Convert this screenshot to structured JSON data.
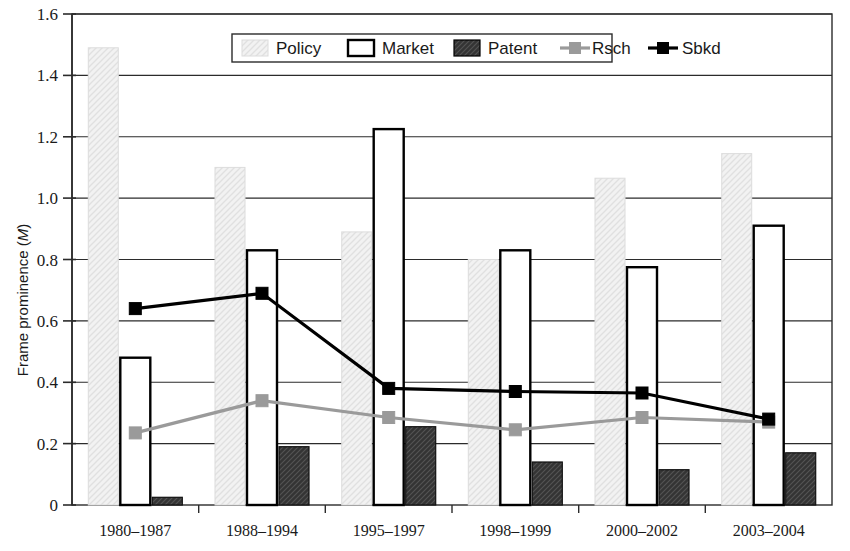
{
  "chart_data": {
    "type": "bar",
    "title": "",
    "xlabel": "",
    "ylabel": "Frame prominence (M)",
    "ylabel_plain": "Frame prominence (",
    "ylabel_italic": "M",
    "ylabel_close": ")",
    "ylim": [
      0,
      1.6
    ],
    "ytick_labels": [
      "0",
      "0.2",
      "0.4",
      "0.6",
      "0.8",
      "1.0",
      "1.2",
      "1.4",
      "1.6"
    ],
    "ytick_values": [
      0,
      0.2,
      0.4,
      0.6,
      0.8,
      1.0,
      1.2,
      1.4,
      1.6
    ],
    "grid": true,
    "grid_orientation": "horizontal",
    "legend_position": "top-center",
    "categories": [
      "1980–1987",
      "1988–1994",
      "1995–1997",
      "1998–1999",
      "2000–2002",
      "2003–2004"
    ],
    "series": [
      {
        "name": "Policy",
        "kind": "bar",
        "style": "light-hatch",
        "color": "#ededed",
        "edge_color": "#d0d0d0",
        "values": [
          1.49,
          1.1,
          0.89,
          0.8,
          1.065,
          1.145
        ]
      },
      {
        "name": "Market",
        "kind": "bar",
        "style": "white-outline",
        "color": "#ffffff",
        "edge_color": "#000000",
        "values": [
          0.48,
          0.83,
          1.225,
          0.83,
          0.775,
          0.91
        ]
      },
      {
        "name": "Patent",
        "kind": "bar",
        "style": "dark-hatch",
        "color": "#3a3a3a",
        "edge_color": "#000000",
        "values": [
          0.025,
          0.19,
          0.255,
          0.14,
          0.115,
          0.17
        ]
      },
      {
        "name": "Rsch",
        "kind": "line",
        "style": "gray-square-marker",
        "color": "#9a9a9a",
        "edge_color": "#9a9a9a",
        "values": [
          0.235,
          0.34,
          0.285,
          0.245,
          0.285,
          0.27
        ]
      },
      {
        "name": "Sbkd",
        "kind": "line",
        "style": "black-square-marker",
        "color": "#000000",
        "edge_color": "#000000",
        "values": [
          0.64,
          0.69,
          0.38,
          0.37,
          0.365,
          0.28
        ]
      }
    ]
  },
  "legend": {
    "items": [
      {
        "label": "Policy",
        "swatch": "light-hatch-swatch"
      },
      {
        "label": "Market",
        "swatch": "white-outline-swatch"
      },
      {
        "label": "Patent",
        "swatch": "dark-hatch-swatch"
      },
      {
        "label": "Rsch",
        "swatch": "gray-line-marker-swatch"
      },
      {
        "label": "Sbkd",
        "swatch": "black-line-marker-swatch"
      }
    ]
  }
}
